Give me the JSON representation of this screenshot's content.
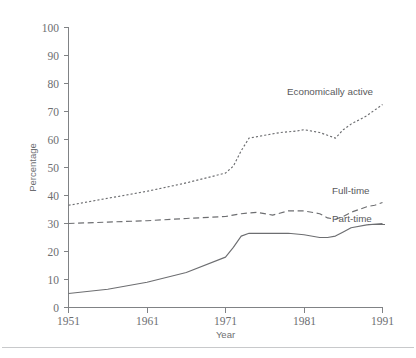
{
  "chart_data": {
    "type": "line",
    "title": "",
    "xlabel": "Year",
    "ylabel": "Percentage",
    "xlim": [
      1951,
      1991
    ],
    "ylim": [
      0,
      100
    ],
    "grid": false,
    "legend_position": "inline-right-labels",
    "xticks": [
      1951,
      1961,
      1971,
      1981,
      1991
    ],
    "yticks": [
      0,
      10,
      20,
      30,
      40,
      50,
      60,
      70,
      80,
      90,
      100
    ],
    "series": [
      {
        "name": "Economically active",
        "style": "dotted",
        "x": [
          1951,
          1956,
          1961,
          1966,
          1971,
          1972,
          1973,
          1974,
          1976,
          1978,
          1980,
          1981,
          1982,
          1983,
          1984,
          1985,
          1986,
          1987,
          1988,
          1989,
          1990,
          1991
        ],
        "values": [
          36.5,
          39.0,
          41.5,
          44.5,
          48.0,
          50.5,
          56.0,
          60.5,
          61.5,
          62.5,
          63.0,
          63.5,
          63.0,
          62.5,
          61.5,
          60.5,
          63.5,
          65.5,
          67.0,
          68.5,
          70.5,
          72.5
        ]
      },
      {
        "name": "Full-time",
        "style": "dashed",
        "x": [
          1951,
          1956,
          1961,
          1966,
          1971,
          1973,
          1975,
          1977,
          1979,
          1981,
          1983,
          1984,
          1985,
          1986,
          1987,
          1988,
          1989,
          1990,
          1991
        ],
        "values": [
          30.0,
          30.5,
          31.0,
          31.8,
          32.5,
          33.5,
          34.0,
          33.0,
          34.5,
          34.5,
          33.5,
          32.0,
          31.5,
          32.5,
          34.0,
          35.0,
          36.0,
          36.5,
          37.5
        ]
      },
      {
        "name": "Part-time",
        "style": "solid",
        "x": [
          1951,
          1956,
          1961,
          1966,
          1971,
          1972,
          1973,
          1974,
          1979,
          1981,
          1983,
          1984,
          1985,
          1986,
          1987,
          1989,
          1991
        ],
        "values": [
          5.0,
          6.5,
          9.0,
          12.5,
          18.0,
          21.5,
          25.5,
          26.5,
          26.5,
          26.0,
          25.0,
          25.0,
          25.5,
          27.0,
          28.5,
          29.5,
          30.0
        ]
      }
    ]
  },
  "axes": {
    "y_axis_title": "Percentage",
    "x_axis_title": "Year",
    "y_tick_labels": [
      "100",
      "90",
      "80",
      "70",
      "60",
      "50",
      "40",
      "30",
      "20",
      "10",
      "0"
    ],
    "x_tick_labels": [
      "1951",
      "1961",
      "1971",
      "1981",
      "1991"
    ]
  },
  "series_labels": {
    "economically_active": "Economically active",
    "full_time": "Full-time",
    "part_time": "Part-time"
  },
  "colors": {
    "line": "#6d6e71",
    "axis": "#808285",
    "text": "#58595b",
    "background": "#ffffff",
    "footer_rule": "#c8c9cb"
  }
}
